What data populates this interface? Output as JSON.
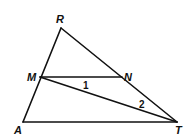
{
  "diagram": {
    "type": "geometry-triangle",
    "vertices": {
      "R": {
        "label": "R",
        "x": 61,
        "y": 28
      },
      "M": {
        "label": "M",
        "x": 40,
        "y": 77
      },
      "N": {
        "label": "N",
        "x": 122,
        "y": 77
      },
      "A": {
        "label": "A",
        "x": 23,
        "y": 122
      },
      "T": {
        "label": "T",
        "x": 177,
        "y": 122
      }
    },
    "segments": [
      {
        "from": "R",
        "to": "A"
      },
      {
        "from": "R",
        "to": "T"
      },
      {
        "from": "A",
        "to": "T"
      },
      {
        "from": "M",
        "to": "N"
      },
      {
        "from": "M",
        "to": "T"
      }
    ],
    "angle_labels": {
      "angle1": {
        "label": "1",
        "x": 86,
        "y": 88
      },
      "angle2": {
        "label": "2",
        "x": 142,
        "y": 108
      }
    },
    "colors": {
      "stroke": "#111111",
      "background": "#ffffff"
    }
  }
}
